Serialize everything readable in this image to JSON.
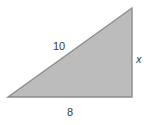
{
  "figure": {
    "type": "right-triangle",
    "fill_color": "#bcbcbc",
    "stroke_color": "#8c8c8c",
    "background_color": "#ffffff",
    "text_color": "#3a3a3a",
    "vertices": {
      "bottom_left": [
        8,
        97
      ],
      "bottom_right": [
        132,
        97
      ],
      "top_right": [
        132,
        8
      ]
    },
    "labels": {
      "hypotenuse": "10",
      "vertical_leg": "x",
      "horizontal_leg": "8"
    }
  }
}
